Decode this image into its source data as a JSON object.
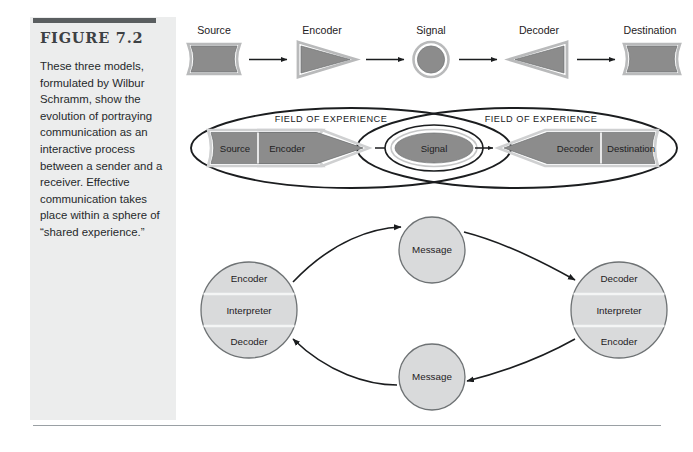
{
  "figure": {
    "rule_color": "#5a5e60",
    "panel_bg": "#eceded",
    "title": "FIGURE 7.2",
    "caption": "These three models, formulated by Wilbur Schramm, show the evolution of portraying communication as an interactive process between a sender and a receiver. Effective communication takes place within a sphere of “shared experience.”"
  },
  "colors": {
    "dark_fill": "#8c8c8c",
    "light_fill": "#d9dadb",
    "outline": "#2b2d2f",
    "shape_edge": "#b9babb",
    "divider": "#f4f5f5"
  },
  "model_one": {
    "name": "linear-transmission-model",
    "nodes": [
      {
        "id": "source",
        "label": "Source",
        "shape": "banner"
      },
      {
        "id": "encoder",
        "label": "Encoder",
        "shape": "triangle-right"
      },
      {
        "id": "signal",
        "label": "Signal",
        "shape": "circle"
      },
      {
        "id": "decoder",
        "label": "Decoder",
        "shape": "triangle-left"
      },
      {
        "id": "destination",
        "label": "Destination",
        "shape": "banner"
      }
    ],
    "arrows": 4
  },
  "model_two": {
    "name": "field-of-experience-model",
    "field_left_label": "FIELD OF EXPERIENCE",
    "field_right_label": "FIELD OF EXPERIENCE",
    "sender_labels": [
      "Source",
      "Encoder"
    ],
    "signal_label": "Signal",
    "receiver_labels": [
      "Decoder",
      "Destination"
    ],
    "arrows": 2
  },
  "model_three": {
    "name": "interactive-circular-model",
    "left_circle": [
      "Encoder",
      "Interpreter",
      "Decoder"
    ],
    "right_circle": [
      "Decoder",
      "Interpreter",
      "Encoder"
    ],
    "top_message": "Message",
    "bottom_message": "Message"
  }
}
